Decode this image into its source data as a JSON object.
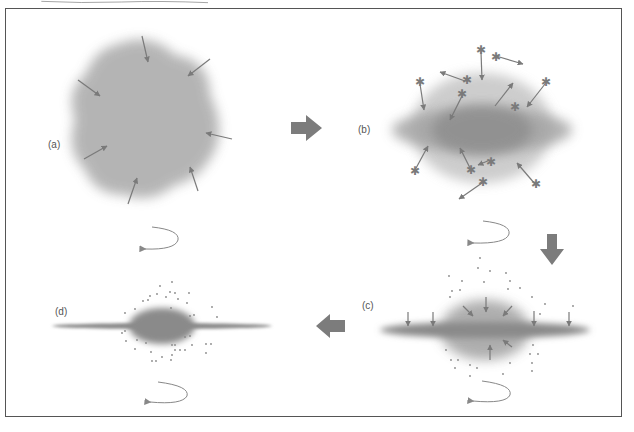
{
  "panels": [
    {
      "id": "a",
      "label": "(a)",
      "description": "Irregular gas cloud contracting under gravity"
    },
    {
      "id": "b",
      "label": "(b)",
      "description": "First stars form; cloud flattens and rotates"
    },
    {
      "id": "c",
      "label": "(c)",
      "description": "Gas collapses into a rotating disk with halo stars"
    },
    {
      "id": "d",
      "label": "(d)",
      "description": "Thin disk galaxy with central bulge and halo"
    }
  ],
  "colors": {
    "cloud": "#9a9a9a",
    "arrow": "#7a7a7a",
    "frame": "#555555",
    "background": "#ffffff"
  }
}
